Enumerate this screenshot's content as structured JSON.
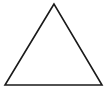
{
  "diagram": {
    "shape": "triangle",
    "stroke_color": "#1a1a1a",
    "fill_color": "none",
    "stroke_width": 1.6,
    "vertices": {
      "apex": [
        54,
        4
      ],
      "bottom_left": [
        5,
        85
      ],
      "bottom_right": [
        102,
        85
      ]
    }
  }
}
